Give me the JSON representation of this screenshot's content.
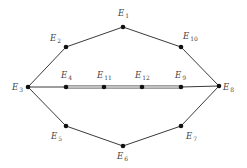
{
  "diagram": {
    "type": "graph",
    "nodes": [
      {
        "id": "E1",
        "base": "E",
        "sub": "1",
        "x": 123,
        "y": 27,
        "lx": 118,
        "ly": 16,
        "la": "start"
      },
      {
        "id": "E2",
        "base": "E",
        "sub": "2",
        "x": 66,
        "y": 47,
        "lx": 50,
        "ly": 41,
        "la": "start"
      },
      {
        "id": "E3",
        "base": "E",
        "sub": "3",
        "x": 28,
        "y": 87,
        "lx": 12,
        "ly": 90,
        "la": "start"
      },
      {
        "id": "E4",
        "base": "E",
        "sub": "4",
        "x": 66,
        "y": 87,
        "lx": 61,
        "ly": 78,
        "la": "start"
      },
      {
        "id": "E5",
        "base": "E",
        "sub": "5",
        "x": 66,
        "y": 126,
        "lx": 51,
        "ly": 139,
        "la": "start"
      },
      {
        "id": "E6",
        "base": "E",
        "sub": "6",
        "x": 123,
        "y": 146,
        "lx": 117,
        "ly": 159,
        "la": "start"
      },
      {
        "id": "E7",
        "base": "E",
        "sub": "7",
        "x": 181,
        "y": 126,
        "lx": 186,
        "ly": 139,
        "la": "start"
      },
      {
        "id": "E8",
        "base": "E",
        "sub": "8",
        "x": 219,
        "y": 86,
        "lx": 223,
        "ly": 90,
        "la": "start"
      },
      {
        "id": "E9",
        "base": "E",
        "sub": "9",
        "x": 181,
        "y": 87,
        "lx": 175,
        "ly": 78,
        "la": "start"
      },
      {
        "id": "E10",
        "base": "E",
        "sub": "10",
        "x": 181,
        "y": 47,
        "lx": 183,
        "ly": 39,
        "la": "start"
      },
      {
        "id": "E11",
        "base": "E",
        "sub": "11",
        "x": 104,
        "y": 87,
        "lx": 97,
        "ly": 78,
        "la": "start"
      },
      {
        "id": "E12",
        "base": "E",
        "sub": "12",
        "x": 142,
        "y": 87,
        "lx": 135,
        "ly": 78,
        "la": "start"
      }
    ],
    "edges": [
      {
        "from": "E1",
        "to": "E2",
        "style": "single"
      },
      {
        "from": "E2",
        "to": "E3",
        "style": "single"
      },
      {
        "from": "E3",
        "to": "E5",
        "style": "single"
      },
      {
        "from": "E5",
        "to": "E6",
        "style": "single"
      },
      {
        "from": "E6",
        "to": "E7",
        "style": "single"
      },
      {
        "from": "E7",
        "to": "E8",
        "style": "single"
      },
      {
        "from": "E8",
        "to": "E10",
        "style": "single"
      },
      {
        "from": "E10",
        "to": "E1",
        "style": "single"
      },
      {
        "from": "E3",
        "to": "E4",
        "style": "single"
      },
      {
        "from": "E4",
        "to": "E11",
        "style": "double"
      },
      {
        "from": "E11",
        "to": "E12",
        "style": "double"
      },
      {
        "from": "E12",
        "to": "E9",
        "style": "double"
      },
      {
        "from": "E9",
        "to": "E8",
        "style": "single"
      }
    ]
  }
}
